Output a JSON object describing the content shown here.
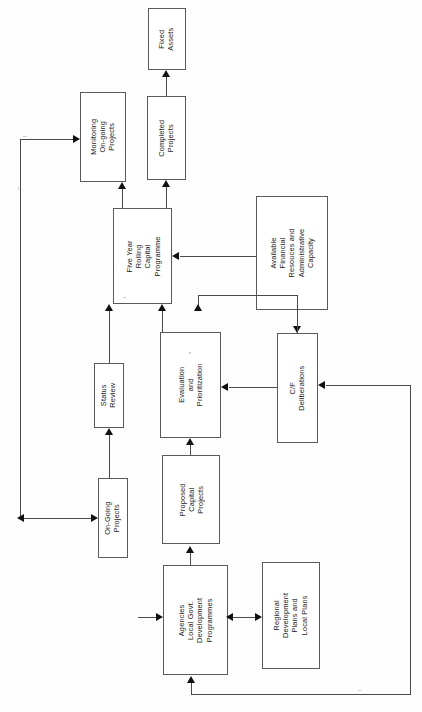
{
  "diagram": {
    "orientation": "rotated-90",
    "line_color": "#4a4a4a",
    "arrow_color": "#101010",
    "box_border_color": "#5a5a5a",
    "background": "#ffffff",
    "nodes": [
      {
        "id": "fixed-assets",
        "lines": [
          "Fixed",
          "Assets"
        ]
      },
      {
        "id": "monitoring",
        "lines": [
          "Monitoring",
          "On-going",
          "Projects"
        ]
      },
      {
        "id": "completed-projects",
        "lines": [
          "Completed",
          "Projects"
        ]
      },
      {
        "id": "five-year",
        "lines": [
          "Five Year",
          "Rolling",
          "Capital",
          "Programme"
        ]
      },
      {
        "id": "available-finance",
        "lines": [
          "Available",
          "Financial",
          "Resouces and",
          "Administrative",
          "Capacity"
        ]
      },
      {
        "id": "status-review",
        "lines": [
          "Status",
          "Review"
        ]
      },
      {
        "id": "evaluation",
        "lines": [
          "Evaluation",
          "and",
          "Prioritization"
        ]
      },
      {
        "id": "cf-deliberations",
        "lines": [
          "C/F",
          "Deliberations"
        ]
      },
      {
        "id": "on-going-projects",
        "lines": [
          "On-Going",
          "Projects"
        ]
      },
      {
        "id": "proposed-capital",
        "lines": [
          "Proposed",
          "Capital",
          "Projects"
        ]
      },
      {
        "id": "agencies",
        "lines": [
          "Agencies",
          "Local Govt.",
          "Development",
          "Programmes"
        ]
      },
      {
        "id": "regional-plans",
        "lines": [
          "Regional",
          "Development",
          "Plans and",
          "Local Plans"
        ]
      }
    ],
    "edges": [
      {
        "from": "completed-projects",
        "to": "fixed-assets",
        "style": "arrow"
      },
      {
        "from": "five-year",
        "to": "completed-projects",
        "style": "arrow"
      },
      {
        "from": "five-year",
        "to": "monitoring",
        "style": "arrow"
      },
      {
        "from": "available-finance",
        "to": "five-year",
        "style": "arrow"
      },
      {
        "from": "available-finance",
        "to": "cf-deliberations",
        "style": "arrow"
      },
      {
        "from": "evaluation",
        "to": "five-year",
        "style": "arrow"
      },
      {
        "from": "cf-deliberations",
        "to": "five-year",
        "style": "arrow"
      },
      {
        "from": "cf-deliberations",
        "to": "evaluation",
        "style": "arrow"
      },
      {
        "from": "proposed-capital",
        "to": "evaluation",
        "style": "arrow"
      },
      {
        "from": "on-going-projects",
        "to": "status-review",
        "style": "arrow"
      },
      {
        "from": "status-review",
        "to": "five-year",
        "style": "arrow"
      },
      {
        "from": "monitoring",
        "to": "on-going-projects",
        "style": "feedback-left"
      },
      {
        "from": "agencies",
        "to": "proposed-capital",
        "style": "arrow"
      },
      {
        "from": "agencies",
        "to": "regional-plans",
        "style": "double-arrow"
      },
      {
        "from": "agencies",
        "to": "cf-deliberations",
        "style": "feedback-right"
      },
      {
        "from": "regional-plans",
        "to": "agencies",
        "style": "double-arrow"
      }
    ]
  }
}
